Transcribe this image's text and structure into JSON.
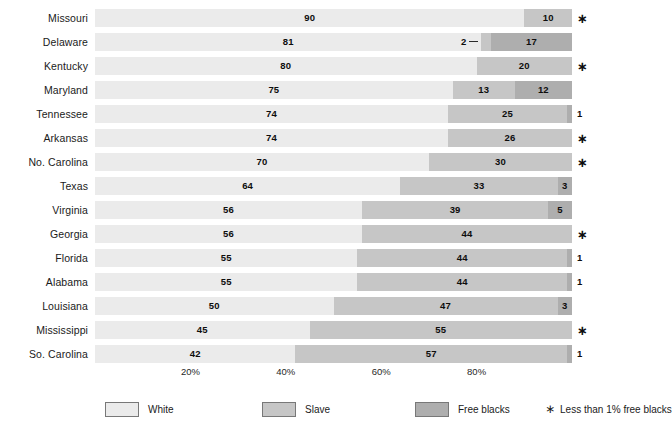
{
  "chart_data": {
    "type": "bar",
    "subtype": "stacked-horizontal-100pct",
    "title": "",
    "xlabel": "",
    "ylabel": "",
    "xlim": [
      0,
      100
    ],
    "grid": false,
    "legend_position": "bottom",
    "categories": [
      "Missouri",
      "Delaware",
      "Kentucky",
      "Maryland",
      "Tennessee",
      "Arkansas",
      "No. Carolina",
      "Texas",
      "Virginia",
      "Georgia",
      "Florida",
      "Alabama",
      "Louisiana",
      "Mississippi",
      "So. Carolina"
    ],
    "series": [
      {
        "name": "White",
        "color": "#ebebeb",
        "values": [
          90,
          81,
          80,
          75,
          74,
          74,
          70,
          64,
          56,
          56,
          55,
          55,
          50,
          45,
          42
        ]
      },
      {
        "name": "Slave",
        "color": "#c6c6c6",
        "values": [
          10,
          2,
          20,
          13,
          25,
          26,
          30,
          33,
          39,
          44,
          44,
          44,
          47,
          55,
          57
        ]
      },
      {
        "name": "Free blacks",
        "color": "#aeaeae",
        "values": [
          0,
          17,
          0,
          12,
          1,
          0,
          0,
          3,
          5,
          0,
          1,
          1,
          3,
          0,
          1
        ]
      }
    ],
    "x_ticks": [
      20,
      40,
      60,
      80
    ],
    "x_tick_labels": [
      "20%",
      "40%",
      "60%",
      "80%"
    ],
    "annotations": {
      "star_symbol": "∗",
      "star_meaning": "Less than 1% free blacks",
      "starred_categories": [
        "Missouri",
        "Kentucky",
        "Arkansas",
        "No. Carolina",
        "Georgia",
        "Mississippi"
      ]
    }
  },
  "rows": [
    {
      "label": "Missouri",
      "white": 90,
      "white_label": "90",
      "slave": 10,
      "slave_label": "10",
      "free": 0,
      "free_label": "",
      "note": "∗",
      "note_is_star": true
    },
    {
      "label": "Delaware",
      "white": 81,
      "white_label": "81",
      "slave": 2,
      "slave_label": "2",
      "slave_callout": true,
      "free": 17,
      "free_label": "17",
      "note": "",
      "note_is_star": false
    },
    {
      "label": "Kentucky",
      "white": 80,
      "white_label": "80",
      "slave": 20,
      "slave_label": "20",
      "free": 0,
      "free_label": "",
      "note": "∗",
      "note_is_star": true
    },
    {
      "label": "Maryland",
      "white": 75,
      "white_label": "75",
      "slave": 13,
      "slave_label": "13",
      "free": 12,
      "free_label": "12",
      "note": "",
      "note_is_star": false
    },
    {
      "label": "Tennessee",
      "white": 74,
      "white_label": "74",
      "slave": 25,
      "slave_label": "25",
      "free": 1,
      "free_label": "",
      "note": "1",
      "note_is_star": false
    },
    {
      "label": "Arkansas",
      "white": 74,
      "white_label": "74",
      "slave": 26,
      "slave_label": "26",
      "free": 0,
      "free_label": "",
      "note": "∗",
      "note_is_star": true
    },
    {
      "label": "No. Carolina",
      "white": 70,
      "white_label": "70",
      "slave": 30,
      "slave_label": "30",
      "free": 0,
      "free_label": "",
      "note": "∗",
      "note_is_star": true
    },
    {
      "label": "Texas",
      "white": 64,
      "white_label": "64",
      "slave": 33,
      "slave_label": "33",
      "free": 3,
      "free_label": "3",
      "note": "",
      "note_is_star": false
    },
    {
      "label": "Virginia",
      "white": 56,
      "white_label": "56",
      "slave": 39,
      "slave_label": "39",
      "free": 5,
      "free_label": "5",
      "note": "",
      "note_is_star": false
    },
    {
      "label": "Georgia",
      "white": 56,
      "white_label": "56",
      "slave": 44,
      "slave_label": "44",
      "free": 0,
      "free_label": "",
      "note": "∗",
      "note_is_star": true
    },
    {
      "label": "Florida",
      "white": 55,
      "white_label": "55",
      "slave": 44,
      "slave_label": "44",
      "free": 1,
      "free_label": "",
      "note": "1",
      "note_is_star": false
    },
    {
      "label": "Alabama",
      "white": 55,
      "white_label": "55",
      "slave": 44,
      "slave_label": "44",
      "free": 1,
      "free_label": "",
      "note": "1",
      "note_is_star": false
    },
    {
      "label": "Louisiana",
      "white": 50,
      "white_label": "50",
      "slave": 47,
      "slave_label": "47",
      "free": 3,
      "free_label": "3",
      "note": "",
      "note_is_star": false
    },
    {
      "label": "Mississippi",
      "white": 45,
      "white_label": "45",
      "slave": 55,
      "slave_label": "55",
      "free": 0,
      "free_label": "",
      "note": "∗",
      "note_is_star": true
    },
    {
      "label": "So. Carolina",
      "white": 42,
      "white_label": "42",
      "slave": 57,
      "slave_label": "57",
      "free": 1,
      "free_label": "",
      "note": "1",
      "note_is_star": false
    }
  ],
  "axis": {
    "ticks": [
      {
        "value": 20,
        "label": "20%"
      },
      {
        "value": 40,
        "label": "40%"
      },
      {
        "value": 60,
        "label": "60%"
      },
      {
        "value": 80,
        "label": "80%"
      }
    ]
  },
  "legend": {
    "items": [
      {
        "label": "White",
        "color": "#ebebeb"
      },
      {
        "label": "Slave",
        "color": "#c6c6c6"
      },
      {
        "label": "Free blacks",
        "color": "#aeaeae"
      }
    ],
    "footnote_symbol": "∗",
    "footnote_text": "Less than 1% free blacks"
  },
  "geometry": {
    "bar_left_px": 95,
    "bar_full_width_px": 477,
    "note_left_px": 577
  }
}
